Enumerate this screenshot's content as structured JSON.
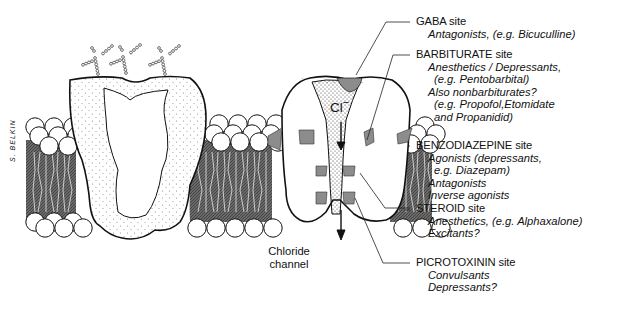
{
  "figure": {
    "ion_label": "Cl",
    "ion_charge": "−",
    "channel_label": [
      "Chloride",
      "channel"
    ],
    "signature": "S. BELKIN",
    "colors": {
      "ink": "#111111",
      "lipid_core": "#5a5a5a",
      "binding_site": "#8c8c8c",
      "background": "#ffffff"
    }
  },
  "sites": [
    {
      "name": "GABA site",
      "lines": [
        {
          "text": "Antagonists, (e.g. Bicuculline)",
          "indent": 1
        }
      ]
    },
    {
      "name": "BARBITURATE site",
      "lines": [
        {
          "text": "Anesthetics / Depressants,",
          "indent": 1
        },
        {
          "text": "(e.g. Pentobarbital)",
          "indent": 2
        },
        {
          "text": "Also nonbarbiturates?",
          "indent": 1
        },
        {
          "text": "(e.g. Propofol,Etomidate",
          "indent": 2
        },
        {
          "text": "and Propanidid)",
          "indent": 2
        }
      ]
    },
    {
      "name": "BENZODIAZEPINE site",
      "lines": [
        {
          "text": "Agonists (depressants,",
          "indent": 1
        },
        {
          "text": "e.g. Diazepam)",
          "indent": 2
        },
        {
          "text": "Antagonists",
          "indent": 1
        },
        {
          "text": "Inverse agonists",
          "indent": 1
        }
      ]
    },
    {
      "name": "STEROID site",
      "lines": [
        {
          "text": "Anesthetics, (e.g. Alphaxalone)",
          "indent": 1
        },
        {
          "text": "Excitants?",
          "indent": 1
        }
      ]
    },
    {
      "name": "PICROTOXININ site",
      "lines": [
        {
          "text": "Convulsants",
          "indent": 1
        },
        {
          "text": "Depressants?",
          "indent": 1
        }
      ]
    }
  ]
}
